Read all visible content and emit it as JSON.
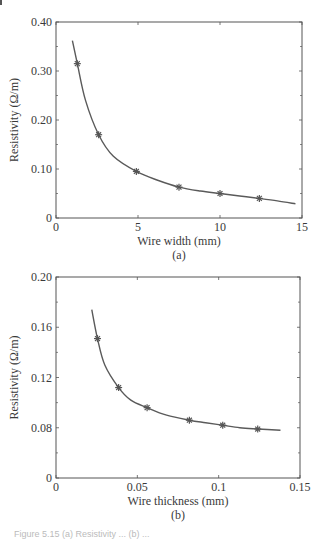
{
  "chart_data": [
    {
      "type": "line",
      "panel_label": "(a)",
      "title": "",
      "xlabel": "Wire width (mm)",
      "ylabel": "Resistivity (Ω/m)",
      "xlim": [
        0,
        15
      ],
      "ylim": [
        0,
        0.4
      ],
      "x_ticks": [
        0,
        5,
        10,
        15
      ],
      "x_tick_labels": [
        "0",
        "5",
        "10",
        "15"
      ],
      "y_ticks": [
        0,
        0.1,
        0.2,
        0.3,
        0.4
      ],
      "y_tick_labels": [
        "0",
        "0.10",
        "0.20",
        "0.30",
        "0.40"
      ],
      "grid": false,
      "legend": null,
      "series": [
        {
          "name": "measured",
          "marker": "asterisk",
          "x": [
            1.3,
            2.6,
            4.9,
            7.5,
            10.0,
            12.4
          ],
          "y": [
            0.315,
            0.17,
            0.095,
            0.063,
            0.05,
            0.04
          ]
        },
        {
          "name": "fit",
          "style": "solid-line",
          "x": [
            1.0,
            1.3,
            1.8,
            2.6,
            3.5,
            4.9,
            6.2,
            7.5,
            8.8,
            10.0,
            11.2,
            12.4,
            13.5,
            14.6
          ],
          "y": [
            0.362,
            0.315,
            0.24,
            0.17,
            0.126,
            0.095,
            0.077,
            0.063,
            0.055,
            0.05,
            0.045,
            0.04,
            0.035,
            0.029
          ]
        }
      ]
    },
    {
      "type": "line",
      "panel_label": "(b)",
      "title": "",
      "xlabel": "Wire thickness (mm)",
      "ylabel": "Resistivity (Ω/m)",
      "xlim": [
        0,
        0.15
      ],
      "ylim": [
        0,
        0.2
      ],
      "x_ticks": [
        0,
        0.05,
        0.1,
        0.15
      ],
      "x_tick_labels": [
        "0",
        "0.05",
        "0.1",
        "0.15"
      ],
      "y_ticks": [
        0,
        0.08,
        0.12,
        0.16,
        0.2
      ],
      "y_tick_labels": [
        "0",
        "0.08",
        "0.12",
        "0.16",
        "0.20"
      ],
      "grid": false,
      "legend": null,
      "series": [
        {
          "name": "measured",
          "marker": "asterisk",
          "x": [
            0.0255,
            0.0385,
            0.056,
            0.082,
            0.1025,
            0.124
          ],
          "y": [
            0.151,
            0.112,
            0.096,
            0.086,
            0.082,
            0.078
          ]
        },
        {
          "name": "fit",
          "style": "solid-line",
          "x": [
            0.022,
            0.0255,
            0.03,
            0.0385,
            0.046,
            0.056,
            0.068,
            0.082,
            0.092,
            0.1025,
            0.113,
            0.124,
            0.138
          ],
          "y": [
            0.174,
            0.151,
            0.13,
            0.112,
            0.102,
            0.096,
            0.09,
            0.086,
            0.084,
            0.082,
            0.08,
            0.078,
            0.076
          ]
        }
      ]
    }
  ],
  "figure": {
    "caption_partial": "Figure 5.15 (a) Resistivity ... (b) ..."
  }
}
